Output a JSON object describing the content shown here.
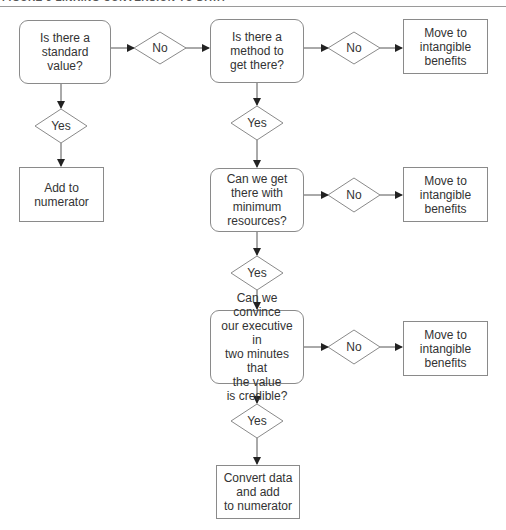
{
  "header": {
    "title": "FIGURE 5 LINKING CONVERSION TO DATA"
  },
  "colors": {
    "stroke": "#8a8a8a",
    "arrow": "#222222",
    "text": "#333333",
    "background": "#ffffff"
  },
  "nodes": {
    "q1": {
      "text": "Is there a\nstandard value?",
      "shape": "rounded-rect"
    },
    "add_numerator": {
      "text": "Add to\nnumerator",
      "shape": "rect"
    },
    "q2": {
      "text": "Is there a\nmethod to\nget there?",
      "shape": "rounded-rect"
    },
    "q3": {
      "text": "Can we get\nthere with\nminimum\nresources?",
      "shape": "rounded-rect"
    },
    "q4": {
      "text": "Can we convince\nour executive in\ntwo minutes that\nthe value\nis credible?",
      "shape": "rounded-rect"
    },
    "intangible1": {
      "text": "Move to\nintangible\nbenefits",
      "shape": "rect"
    },
    "intangible2": {
      "text": "Move to\nintangible\nbenefits",
      "shape": "rect"
    },
    "intangible3": {
      "text": "Move to\nintangible\nbenefits",
      "shape": "rect"
    },
    "convert": {
      "text": "Convert data\nand add\nto numerator",
      "shape": "rect"
    }
  },
  "decisions": {
    "d_no1": "No",
    "d_yes1": "Yes",
    "d_yes2": "Yes",
    "d_no2": "No",
    "d_yes3": "Yes",
    "d_no3": "No",
    "d_yes4": "Yes"
  },
  "edges": [
    {
      "from": "q1",
      "to": "d_no1"
    },
    {
      "from": "d_no1",
      "to": "q2"
    },
    {
      "from": "q1",
      "to": "d_yes1"
    },
    {
      "from": "d_yes1",
      "to": "add_numerator"
    },
    {
      "from": "q2",
      "to": "d_no_top"
    },
    {
      "from": "q2",
      "to": "d_yes2"
    },
    {
      "from": "d_yes2",
      "to": "q3"
    },
    {
      "from": "q3",
      "to": "d_no2"
    },
    {
      "from": "d_no2",
      "to": "intangible2"
    },
    {
      "from": "q3",
      "to": "d_yes3"
    },
    {
      "from": "d_yes3",
      "to": "q4"
    },
    {
      "from": "q4",
      "to": "d_no3"
    },
    {
      "from": "d_no3",
      "to": "intangible3"
    },
    {
      "from": "q4",
      "to": "d_yes4"
    },
    {
      "from": "d_yes4",
      "to": "convert"
    }
  ],
  "extra_decisions": {
    "d_no_top": "No"
  }
}
